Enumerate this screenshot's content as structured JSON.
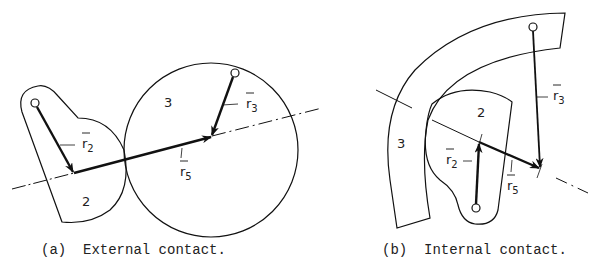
{
  "figure_a": {
    "caption": "(a)  External contact.",
    "body_labels": {
      "link2": "2",
      "link3": "3"
    },
    "vectors": [
      {
        "name": "r",
        "subscript": "2"
      },
      {
        "name": "r",
        "subscript": "3"
      },
      {
        "name": "r",
        "subscript": "5"
      }
    ]
  },
  "figure_b": {
    "caption": "(b)  Internal contact.",
    "body_labels": {
      "link2": "2",
      "link3": "3"
    },
    "vectors": [
      {
        "name": "r",
        "subscript": "2"
      },
      {
        "name": "r",
        "subscript": "3"
      },
      {
        "name": "r",
        "subscript": "5"
      }
    ]
  }
}
